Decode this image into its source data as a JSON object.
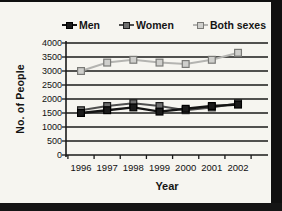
{
  "frame": {
    "border_color": "#101010",
    "background": "#f6f5f0"
  },
  "chart_data": {
    "type": "line",
    "title": "",
    "xlabel": "Year",
    "ylabel": "No. of People",
    "categories": [
      "1996",
      "1997",
      "1998",
      "1999",
      "2000",
      "2001",
      "2002"
    ],
    "series": [
      {
        "name": "Men",
        "values": [
          1500,
          1600,
          1700,
          1550,
          1650,
          1750,
          1800
        ],
        "line_color": "#141414",
        "marker_fill": "#1a1a1a",
        "marker_stroke": "#000000"
      },
      {
        "name": "Women",
        "values": [
          1600,
          1750,
          1850,
          1750,
          1600,
          1700,
          1850
        ],
        "line_color": "#4f4f4f",
        "marker_fill": "#6e6e6e",
        "marker_stroke": "#1c1c1c"
      },
      {
        "name": "Both sexes",
        "values": [
          3000,
          3300,
          3400,
          3300,
          3250,
          3400,
          3650
        ],
        "line_color": "#b4b4b1",
        "marker_fill": "#cfcfcc",
        "marker_stroke": "#7a7a77"
      }
    ],
    "ylim": [
      0,
      4000
    ],
    "ytick_step": 500,
    "yticks": [
      0,
      500,
      1000,
      1500,
      2000,
      2500,
      3000,
      3500,
      4000
    ],
    "grid": true,
    "gridline_color": "#1a1a1a",
    "legend_position": "top"
  }
}
